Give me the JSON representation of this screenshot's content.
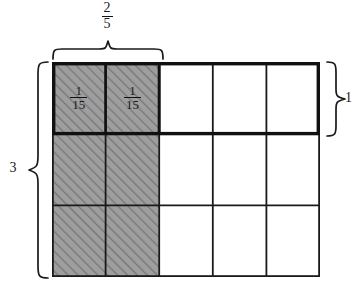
{
  "figure": {
    "grid": {
      "columns": 5,
      "rows": 3,
      "x": 52,
      "y": 62,
      "width": 268,
      "height": 215,
      "shaded_columns": 2,
      "shaded_rows": 3,
      "shaded_fill": "#9a9a9a",
      "hatch_color": "#6f6f6f",
      "line_color": "#1a1a1a",
      "thin_line_width": 1.6,
      "thick_line_width": 3.4
    },
    "cell_labels": [
      {
        "text_num": "1",
        "text_den": "15",
        "row": 0,
        "col": 0
      },
      {
        "text_num": "1",
        "text_den": "15",
        "row": 0,
        "col": 1
      }
    ],
    "top_brace": {
      "label_num": "2",
      "label_den": "5",
      "spans_columns": 2,
      "x_start": 52,
      "x_end": 160,
      "y": 52
    },
    "left_brace": {
      "label": "3",
      "spans_rows": 3,
      "y_start": 62,
      "y_end": 277,
      "x": 40
    },
    "right_brace": {
      "label": "1",
      "spans_rows": 1,
      "y_start": 62,
      "y_end": 133,
      "x": 330
    },
    "emphasized_row": {
      "index": 0,
      "description": "first row outlined with thick border"
    }
  }
}
